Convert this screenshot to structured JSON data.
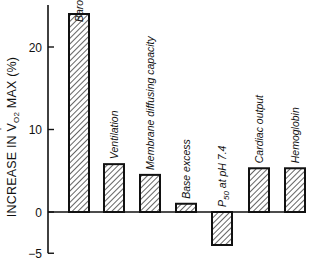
{
  "chart_data": {
    "type": "bar",
    "title": "",
    "xlabel": "",
    "ylabel": "INCREASE IN VO2 MAX (%)",
    "ylabel_parts": {
      "pre": "INCREASE IN ",
      "v": "V",
      "sub": "O2",
      "post": " MAX (%)"
    },
    "ylim": [
      -5,
      25
    ],
    "yticks": [
      20,
      10,
      0,
      -5
    ],
    "grid": false,
    "legend": null,
    "categories": [
      "Barometric pressure",
      "Ventilation",
      "Membrane diffusing capacity",
      "Base excess",
      "P50 at pH 7.4",
      "Cardiac output",
      "Hemoglobin"
    ],
    "values": [
      24,
      5.8,
      4.5,
      1.0,
      -4.0,
      5.3,
      5.3
    ],
    "bar_fill": "diagonal hatch",
    "colors": {
      "ink": "#111111",
      "background": "#ffffff"
    }
  }
}
